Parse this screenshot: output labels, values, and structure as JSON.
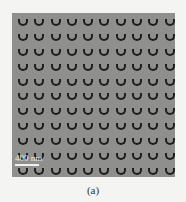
{
  "figure": {
    "panel": {
      "description": "SEM image of periodic array of U-shaped (split-ring) nanostructures",
      "rows": 11,
      "cols": 10,
      "background_color": "#8f908d",
      "feature_color": "#1e1e1e",
      "scale_bar": {
        "label": "400 nm"
      }
    },
    "caption": "(a)"
  }
}
